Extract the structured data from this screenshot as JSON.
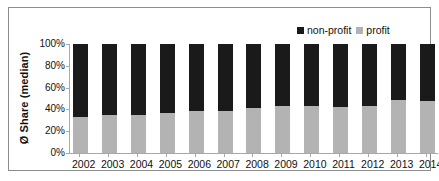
{
  "chart_data": {
    "type": "bar",
    "stacked": true,
    "stacked_normalized": true,
    "title": "",
    "subtitle": "",
    "xlabel": "",
    "ylabel": "Ø Share (median)",
    "categories": [
      "2002",
      "2003",
      "2004",
      "2005",
      "2006",
      "2007",
      "2008",
      "2009",
      "2010",
      "2011",
      "2012",
      "2013",
      "2014"
    ],
    "series": [
      {
        "name": "non-profit",
        "color": "#1a1a1a",
        "values": [
          67,
          65,
          65,
          63,
          61,
          61,
          59,
          57,
          57,
          58,
          57,
          51,
          52
        ]
      },
      {
        "name": "profit",
        "color": "#b3b3b3",
        "values": [
          33,
          35,
          35,
          37,
          39,
          39,
          41,
          43,
          43,
          42,
          43,
          49,
          48
        ]
      }
    ],
    "ylim": [
      0,
      100
    ],
    "ytick_labels": [
      "100%",
      "80%",
      "60%",
      "40%",
      "20%",
      "0%"
    ],
    "ytick_values": [
      100,
      80,
      60,
      40,
      20,
      0
    ],
    "grid": false,
    "legend_position": "top-right",
    "value_unit": "%"
  },
  "legend": {
    "entries": [
      {
        "label": "non-profit",
        "color": "#1a1a1a"
      },
      {
        "label": "profit",
        "color": "#b3b3b3"
      }
    ]
  },
  "axes": {
    "y_title": "Ø Share (median)",
    "y_ticks": [
      "100%",
      "80%",
      "60%",
      "40%",
      "20%",
      "0%"
    ],
    "x_ticks": [
      "2002",
      "2003",
      "2004",
      "2005",
      "2006",
      "2007",
      "2008",
      "2009",
      "2010",
      "2011",
      "2012",
      "2013",
      "2014"
    ]
  },
  "colors": {
    "nonprofit": "#1a1a1a",
    "profit": "#b3b3b3",
    "frame": "#8d8d8d",
    "axis": "#a8a8a8",
    "background": "#ffffff",
    "text": "#111111"
  }
}
